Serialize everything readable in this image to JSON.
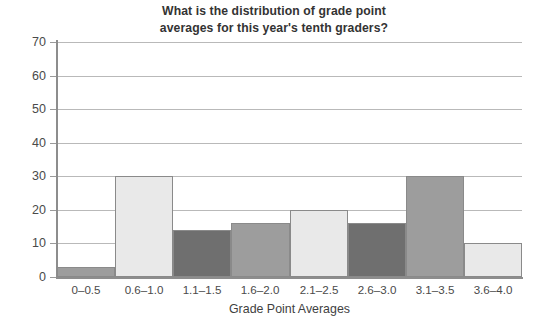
{
  "chart_data": {
    "type": "bar",
    "title": "What is the distribution of grade point averages for this year's tenth graders?",
    "title_line1": "What is the distribution of grade point",
    "title_line2": "averages for this year's tenth graders?",
    "xlabel": "Grade Point Averages",
    "ylabel": "",
    "categories": [
      "0–0.5",
      "0.6–1.0",
      "1.1–1.5",
      "1.6–2.0",
      "2.1–2.5",
      "2.6–3.0",
      "3.1–3.5",
      "3.6–4.0"
    ],
    "values": [
      3,
      30,
      14,
      16,
      20,
      16,
      30,
      10
    ],
    "bar_colors": [
      "#9d9d9d",
      "#e9e9e9",
      "#6f6f6f",
      "#9d9d9d",
      "#e9e9e9",
      "#6f6f6f",
      "#9d9d9d",
      "#e9e9e9"
    ],
    "ylim": [
      0,
      70
    ],
    "ytick_labels": [
      "70",
      "60",
      "50",
      "40",
      "30",
      "20",
      "10",
      "0"
    ],
    "ytick_values": [
      70,
      60,
      50,
      40,
      30,
      20,
      10,
      0
    ],
    "ystep": 10,
    "grid": true,
    "grid_color": "#b9b9b9",
    "axis_color": "#8d8d8d",
    "bar_border_color": "#8a8a8a",
    "legend": null,
    "legend_position": "none",
    "background": "#ffffff"
  }
}
